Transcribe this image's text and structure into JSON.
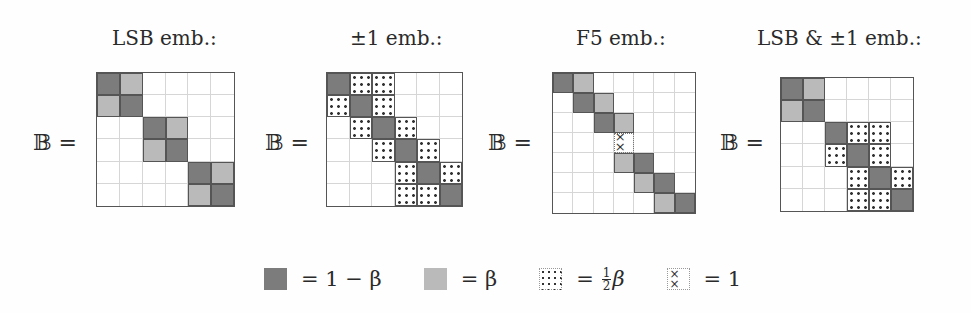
{
  "figure": {
    "matrix_symbol": "𝔹 =",
    "panels": [
      {
        "id": "lsb",
        "title": "LSB emb.:",
        "size": 6,
        "rows": [
          [
            "D",
            "L",
            "",
            "",
            "",
            ""
          ],
          [
            "L",
            "D",
            "",
            "",
            "",
            ""
          ],
          [
            "",
            "",
            "D",
            "L",
            "",
            ""
          ],
          [
            "",
            "",
            "L",
            "D",
            "",
            ""
          ],
          [
            "",
            "",
            "",
            "",
            "D",
            "L"
          ],
          [
            "",
            "",
            "",
            "",
            "L",
            "D"
          ]
        ]
      },
      {
        "id": "pm1",
        "title": "±1 emb.:",
        "size": 6,
        "rows": [
          [
            "D",
            "S",
            "S",
            "",
            "",
            ""
          ],
          [
            "S",
            "D",
            "S",
            "",
            "",
            ""
          ],
          [
            "",
            "S",
            "D",
            "S",
            "",
            ""
          ],
          [
            "",
            "",
            "S",
            "D",
            "S",
            ""
          ],
          [
            "",
            "",
            "",
            "S",
            "D",
            "S"
          ],
          [
            "",
            "",
            "",
            "S",
            "S",
            "D"
          ]
        ]
      },
      {
        "id": "f5",
        "title": "F5 emb.:",
        "size": 7,
        "rows": [
          [
            "D",
            "L",
            "",
            "",
            "",
            "",
            ""
          ],
          [
            "",
            "D",
            "L",
            "",
            "",
            "",
            ""
          ],
          [
            "",
            "",
            "D",
            "L",
            "",
            "",
            ""
          ],
          [
            "",
            "",
            "",
            "X",
            "",
            "",
            ""
          ],
          [
            "",
            "",
            "",
            "L",
            "D",
            "",
            ""
          ],
          [
            "",
            "",
            "",
            "",
            "L",
            "D",
            ""
          ],
          [
            "",
            "",
            "",
            "",
            "",
            "L",
            "D"
          ]
        ]
      },
      {
        "id": "lsb-pm1",
        "title": "LSB & ±1 emb.:",
        "size": 6,
        "rows": [
          [
            "D",
            "L",
            "",
            "",
            "",
            ""
          ],
          [
            "L",
            "D",
            "",
            "",
            "",
            ""
          ],
          [
            "",
            "",
            "D",
            "S",
            "S",
            ""
          ],
          [
            "",
            "",
            "S",
            "D",
            "S",
            ""
          ],
          [
            "",
            "",
            "",
            "S",
            "D",
            "S"
          ],
          [
            "",
            "",
            "",
            "S",
            "S",
            "D"
          ]
        ]
      }
    ],
    "legend": [
      {
        "key": "D",
        "label": "= 1 − β",
        "meaning": "dark gray"
      },
      {
        "key": "L",
        "label": "= β",
        "meaning": "light gray"
      },
      {
        "key": "S",
        "label_prefix": "=",
        "frac_num": "1",
        "frac_den": "2",
        "label_suffix": "β",
        "meaning": "dotted"
      },
      {
        "key": "X",
        "label": "= 1",
        "meaning": "crossed"
      }
    ],
    "colors": {
      "dark": "#7c7c7c",
      "light": "#bababa",
      "grid_line": "#d6d6d6",
      "border": "#555555"
    }
  }
}
